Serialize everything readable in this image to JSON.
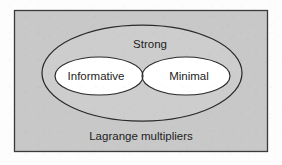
{
  "figure": {
    "type": "venn-diagram",
    "caption_label": "Lagrange multipliers",
    "universe_label": "Strong",
    "sets": [
      {
        "id": "informative",
        "label": "Informative"
      },
      {
        "id": "minimal",
        "label": "Minimal"
      }
    ],
    "colors": {
      "plate_background": "#fdfdfd",
      "frame_fill": "#c8c8c8",
      "frame_stroke": "#3a3a3a",
      "outer_ellipse_fill": "#cdcdcd",
      "outer_ellipse_stroke": "#2b2b2b",
      "inner_ellipse_fill": "#ffffff",
      "inner_ellipse_stroke": "#2b2b2b",
      "text_color": "#1d1d1d"
    },
    "geometry": {
      "frame": {
        "x": 14,
        "y": 10,
        "width": 254,
        "height": 142
      },
      "outer_ellipse": {
        "cx": 142,
        "cy": 73,
        "rx": 100,
        "ry": 48
      },
      "left_ellipse": {
        "cx": 99,
        "cy": 76,
        "rx": 44,
        "ry": 19
      },
      "right_ellipse": {
        "cx": 186,
        "cy": 76,
        "rx": 44,
        "ry": 19
      },
      "strong_label_pos": {
        "x": 150,
        "y": 45
      },
      "left_label_pos": {
        "x": 96,
        "y": 76
      },
      "right_label_pos": {
        "x": 189,
        "y": 76
      },
      "caption_pos": {
        "x": 141,
        "y": 137
      }
    }
  }
}
